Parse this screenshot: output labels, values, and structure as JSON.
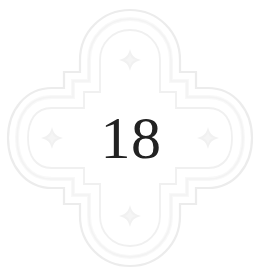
{
  "page": {
    "background_color": "#ffffff",
    "width": 260,
    "height": 276
  },
  "chapter_heading": {
    "number": "18",
    "number_color": "#222222",
    "ornament_name": "quatrefoil-chapter-ornament",
    "ornament_line_color": "#ededed",
    "ornament_accent_color": "#f2f2f2",
    "lobe_star_count": 4,
    "lobes": [
      {
        "position": "top",
        "star_icon": "four-pointed-star-icon"
      },
      {
        "position": "right",
        "star_icon": "four-pointed-star-icon"
      },
      {
        "position": "bottom",
        "star_icon": "four-pointed-star-icon"
      },
      {
        "position": "left",
        "star_icon": "four-pointed-star-icon"
      }
    ]
  }
}
